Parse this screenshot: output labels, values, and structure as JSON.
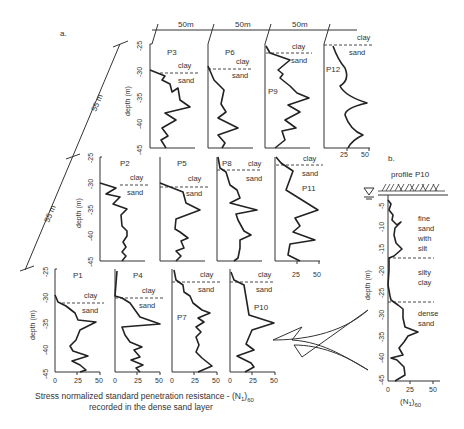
{
  "figure": {
    "panel_a_label": "a.",
    "panel_b_label": "b.",
    "spacing_labels": {
      "horizontal": "50m",
      "diagonal": "55 m"
    },
    "y_axis_label": "depth (m)",
    "x_axis_title_line1": "Stress normalized standard penetration resistance - (N",
    "x_axis_title_sub1": "1",
    "x_axis_title_sub2": ")",
    "x_axis_title_sub3": "60",
    "x_axis_title_line2": "recorded in the dense sand layer",
    "layer_labels": {
      "clay": "clay",
      "sand": "sand"
    },
    "depth_ticks": [
      "-25",
      "-30",
      "-35",
      "-40",
      "-45"
    ],
    "n_ticks": [
      "0",
      "25",
      "50"
    ]
  },
  "profile_b": {
    "title": "profile P10",
    "depth_ticks": [
      "-5",
      "-10",
      "-15",
      "-20",
      "-25",
      "-30",
      "-35",
      "-40",
      "-45"
    ],
    "y_axis_label": "depth (m)",
    "x_ticks": [
      "0",
      "25",
      "50"
    ],
    "x_label": "(N",
    "x_label_sub1": "1",
    "x_label_close": ")",
    "x_label_sub2": "60",
    "layers": [
      {
        "name_lines": [
          "fine",
          "sand",
          "with",
          "silt"
        ]
      },
      {
        "name_lines": [
          "silty",
          "clay"
        ]
      },
      {
        "name_lines": [
          "dense",
          "sand"
        ]
      }
    ]
  },
  "panels": [
    {
      "id": "P1",
      "row": 3,
      "col": 1
    },
    {
      "id": "P2",
      "row": 2,
      "col": 1
    },
    {
      "id": "P3",
      "row": 1,
      "col": 1
    },
    {
      "id": "P4",
      "row": 3,
      "col": 2
    },
    {
      "id": "P5",
      "row": 2,
      "col": 2
    },
    {
      "id": "P6",
      "row": 1,
      "col": 2
    },
    {
      "id": "P7",
      "row": 3,
      "col": 3
    },
    {
      "id": "P8",
      "row": 2,
      "col": 3
    },
    {
      "id": "P9",
      "row": 1,
      "col": 3
    },
    {
      "id": "P10",
      "row": 3,
      "col": 4
    },
    {
      "id": "P11",
      "row": 2,
      "col": 4
    },
    {
      "id": "P12",
      "row": 1,
      "col": 4
    }
  ]
}
